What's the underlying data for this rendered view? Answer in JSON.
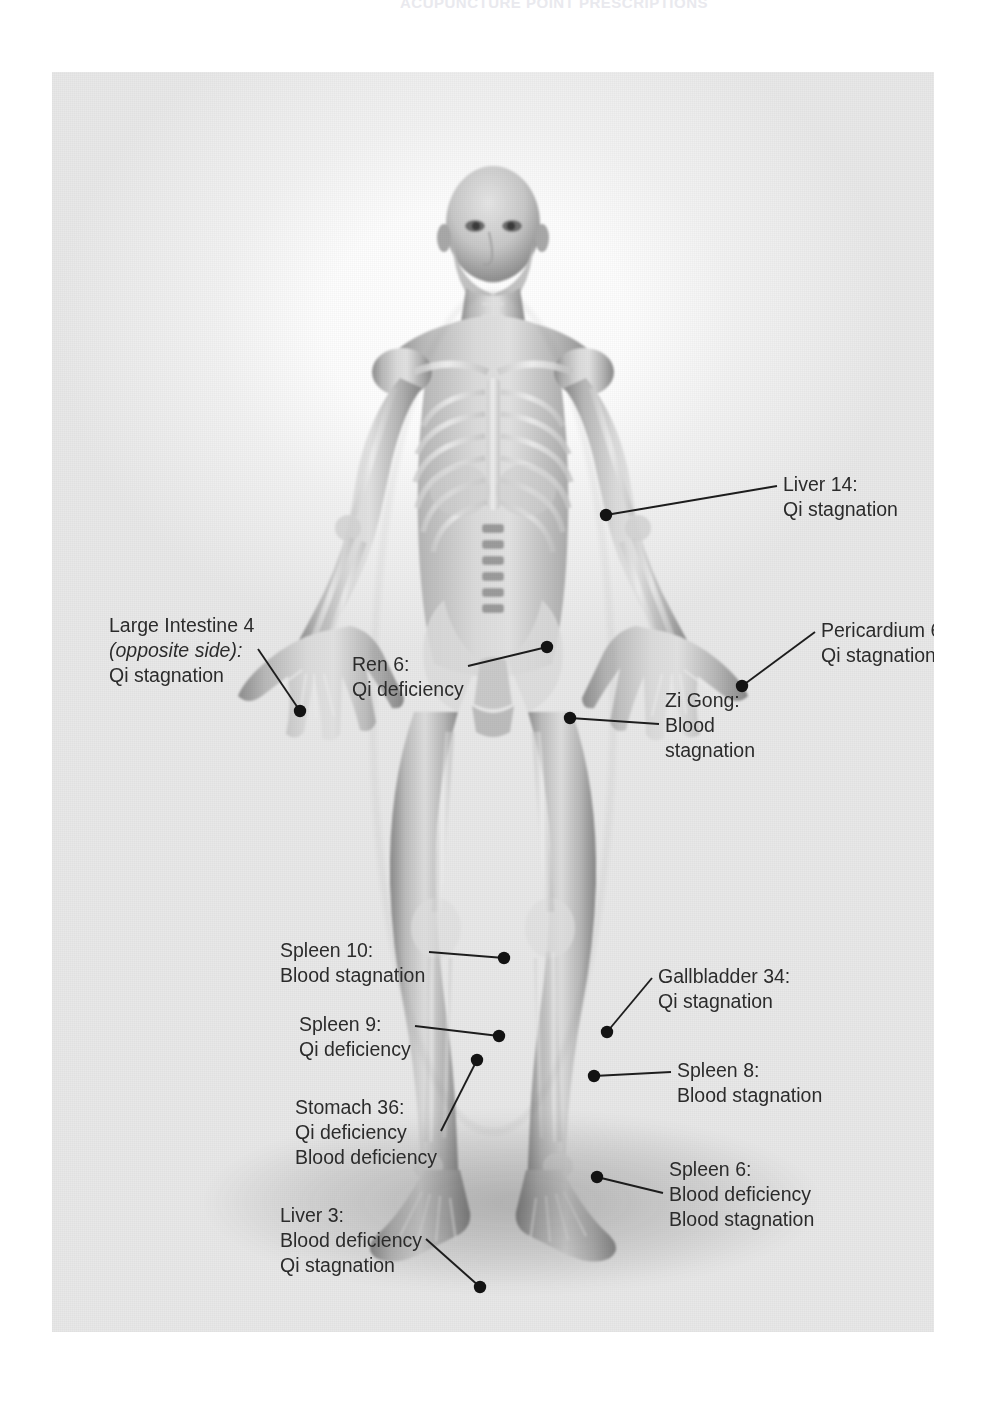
{
  "running_head": "ACUPUNCTURE POINT PRESCRIPTIONS",
  "plate": {
    "figure_alt": "anterior view of female anatomical figure with skeleton overlay",
    "marker_color": "#131313",
    "leader_color": "#1d1d1d",
    "text_color": "#2b2b2b"
  },
  "points": [
    {
      "id": "liver-14",
      "title": "Liver 14:",
      "lines": [
        "Qi stagnation"
      ],
      "marker": {
        "x": 554,
        "y": 443
      },
      "label": {
        "x": 731,
        "y": 400
      }
    },
    {
      "id": "large-intestine-4",
      "title": "Large Intestine 4",
      "subtitle": "(opposite side):",
      "subtitle_italic": true,
      "lines": [
        "Qi stagnation"
      ],
      "marker": {
        "x": 248,
        "y": 639
      },
      "label": {
        "x": 57,
        "y": 541
      }
    },
    {
      "id": "ren-6",
      "title": "Ren 6:",
      "lines": [
        "Qi deficiency"
      ],
      "marker": {
        "x": 495,
        "y": 575
      },
      "label": {
        "x": 300,
        "y": 580
      }
    },
    {
      "id": "pericardium-6",
      "title": "Pericardium 6:",
      "lines": [
        "Qi stagnation"
      ],
      "marker": {
        "x": 690,
        "y": 614
      },
      "label": {
        "x": 769,
        "y": 546
      }
    },
    {
      "id": "zi-gong",
      "title": "Zi Gong:",
      "lines": [
        "Blood",
        "stagnation"
      ],
      "marker": {
        "x": 518,
        "y": 646
      },
      "label": {
        "x": 613,
        "y": 616
      }
    },
    {
      "id": "spleen-10",
      "title": "Spleen 10:",
      "lines": [
        "Blood stagnation"
      ],
      "marker": {
        "x": 452,
        "y": 886
      },
      "label": {
        "x": 228,
        "y": 866
      }
    },
    {
      "id": "spleen-9",
      "title": "Spleen 9:",
      "lines": [
        "Qi deficiency"
      ],
      "marker": {
        "x": 447,
        "y": 964
      },
      "label": {
        "x": 247,
        "y": 940
      }
    },
    {
      "id": "stomach-36",
      "title": "Stomach 36:",
      "lines": [
        "Qi deficiency",
        "Blood deficiency"
      ],
      "marker": {
        "x": 425,
        "y": 988
      },
      "label": {
        "x": 243,
        "y": 1023
      }
    },
    {
      "id": "gallbladder-34",
      "title": "Gallbladder 34:",
      "lines": [
        "Qi stagnation"
      ],
      "marker": {
        "x": 555,
        "y": 960
      },
      "label": {
        "x": 606,
        "y": 892
      }
    },
    {
      "id": "spleen-8",
      "title": "Spleen 8:",
      "lines": [
        "Blood stagnation"
      ],
      "marker": {
        "x": 542,
        "y": 1004
      },
      "label": {
        "x": 625,
        "y": 986
      }
    },
    {
      "id": "spleen-6",
      "title": "Spleen 6:",
      "lines": [
        "Blood deficiency",
        "Blood stagnation"
      ],
      "marker": {
        "x": 545,
        "y": 1105
      },
      "label": {
        "x": 617,
        "y": 1085
      }
    },
    {
      "id": "liver-3",
      "title": "Liver 3:",
      "lines": [
        "Blood deficiency",
        "Qi stagnation"
      ],
      "marker": {
        "x": 428,
        "y": 1215
      },
      "label": {
        "x": 228,
        "y": 1131
      }
    }
  ]
}
